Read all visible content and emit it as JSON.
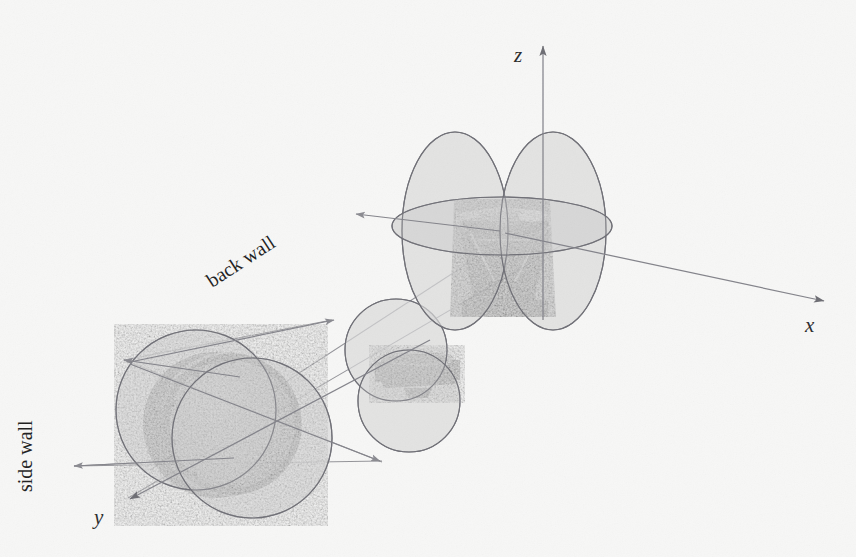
{
  "figure": {
    "name": "antenna-radiation-pattern-3d-diagram",
    "background_color": "#f7f7f6",
    "lobe_fill_color": "#d9d9d9",
    "lobe_stroke_color": "#6e6e74",
    "axis_color": "#7a7a80",
    "text_color": "#1e1e1e"
  },
  "axes": [
    {
      "id": "z",
      "label": "z",
      "label_x": 516,
      "label_y": 58,
      "direction": "up"
    },
    {
      "id": "x",
      "label": "x",
      "label_x": 806,
      "label_y": 330,
      "direction": "right-down"
    },
    {
      "id": "y",
      "label": "y",
      "label_x": 96,
      "label_y": 522,
      "direction": "left-down"
    }
  ],
  "annotations": [
    {
      "id": "back-wall",
      "label": "back wall",
      "x": 268,
      "y": 268,
      "rotation": -33
    },
    {
      "id": "side-wall",
      "label": "side wall",
      "x": 22,
      "y": 462,
      "rotation": -90
    }
  ],
  "antennas": [
    {
      "id": "back-wall-antenna",
      "name": "back wall parabolic reflector antenna",
      "cx": 502,
      "cy": 258,
      "photo_width": 96,
      "photo_height": 118,
      "lobes": [
        {
          "type": "ellipse",
          "cx": 455,
          "cy": 231,
          "rx": 52,
          "ry": 98,
          "rot": 0
        },
        {
          "type": "ellipse",
          "cx": 553,
          "cy": 231,
          "rx": 52,
          "ry": 98,
          "rot": 0
        },
        {
          "type": "ellipse",
          "cx": 502,
          "cy": 225,
          "rx": 110,
          "ry": 28,
          "rot": 0
        }
      ]
    },
    {
      "id": "middle-antenna",
      "name": "middle small antenna",
      "cx": 410,
      "cy": 372,
      "photo_width": 82,
      "photo_height": 54,
      "lobes": [
        {
          "type": "ellipse",
          "cx": 396,
          "cy": 350,
          "rx": 50,
          "ry": 50,
          "rot": 0
        },
        {
          "type": "ellipse",
          "cx": 408,
          "cy": 400,
          "rx": 50,
          "ry": 50,
          "rot": 0
        }
      ]
    },
    {
      "id": "side-wall-antenna",
      "name": "side wall parabolic reflector antenna",
      "cx": 222,
      "cy": 425,
      "photo_width": 140,
      "photo_height": 140,
      "lobes": [
        {
          "type": "ellipse",
          "cx": 196,
          "cy": 410,
          "rx": 78,
          "ry": 78,
          "rot": 0
        },
        {
          "type": "ellipse",
          "cx": 252,
          "cy": 438,
          "rx": 78,
          "ry": 78,
          "rot": 0
        }
      ]
    }
  ],
  "rays": [
    {
      "id": "ray-z-up",
      "x1": 543,
      "y1": 318,
      "x2": 543,
      "y2": 44
    },
    {
      "id": "ray-x-right",
      "x1": 502,
      "y1": 232,
      "x2": 826,
      "y2": 302
    },
    {
      "id": "ray-back-left",
      "x1": 502,
      "y1": 232,
      "x2": 352,
      "y2": 214
    },
    {
      "id": "ray-to-side-wall",
      "x1": 540,
      "y1": 250,
      "x2": 128,
      "y2": 500
    },
    {
      "id": "ray-side-horiz",
      "x1": 238,
      "y1": 378,
      "x2": 122,
      "y2": 361
    },
    {
      "id": "ray-side-horiz-2",
      "x1": 232,
      "y1": 456,
      "x2": 72,
      "y2": 466
    },
    {
      "id": "ray-side-up",
      "x1": 122,
      "y1": 361,
      "x2": 330,
      "y2": 322
    },
    {
      "id": "ray-side-diag-up",
      "x1": 122,
      "y1": 361,
      "x2": 380,
      "y2": 462
    },
    {
      "id": "ray-side-diag-dn",
      "x1": 72,
      "y1": 466,
      "x2": 380,
      "y2": 462
    }
  ]
}
